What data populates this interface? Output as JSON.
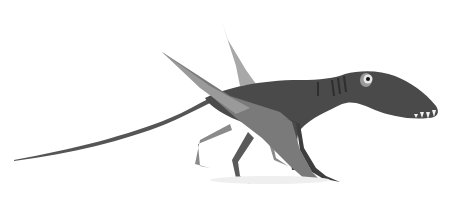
{
  "image": {
    "subject": "Pterosaur illustration (Dimorphodon-like), walking quadrupedally with wings folded",
    "style": "grayscale pencil/watercolor illustration on white background",
    "background_color": "#ffffff",
    "colors": {
      "body": "#4a4a4a",
      "body_dark": "#333333",
      "wing": "#7a7a7a",
      "wing_light": "#9a9a9a",
      "wing_far": "#a8a8a8",
      "tail": "#555555",
      "eye_ring": "#e8e8e8",
      "eye_pupil": "#111111",
      "teeth": "#f2f2f2"
    },
    "caption": "Pterosaur"
  }
}
